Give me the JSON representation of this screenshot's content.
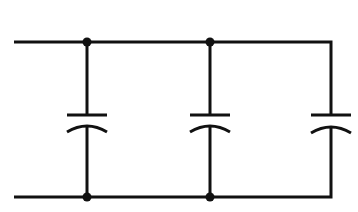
{
  "diagram": {
    "type": "circuit-schematic",
    "wire_color": "#111111",
    "background": "#ffffff",
    "components": [
      {
        "id": "C1",
        "kind": "capacitor",
        "x": 87
      },
      {
        "id": "C2",
        "kind": "capacitor",
        "x": 210
      },
      {
        "id": "C3",
        "kind": "capacitor",
        "x": 331
      }
    ],
    "junctions": [
      {
        "x": 87,
        "y": 42
      },
      {
        "x": 210,
        "y": 42
      },
      {
        "x": 87,
        "y": 197
      },
      {
        "x": 210,
        "y": 197
      }
    ],
    "rails": {
      "top_y": 42,
      "bottom_y": 197,
      "left_x": 14,
      "right_x": 331
    }
  }
}
